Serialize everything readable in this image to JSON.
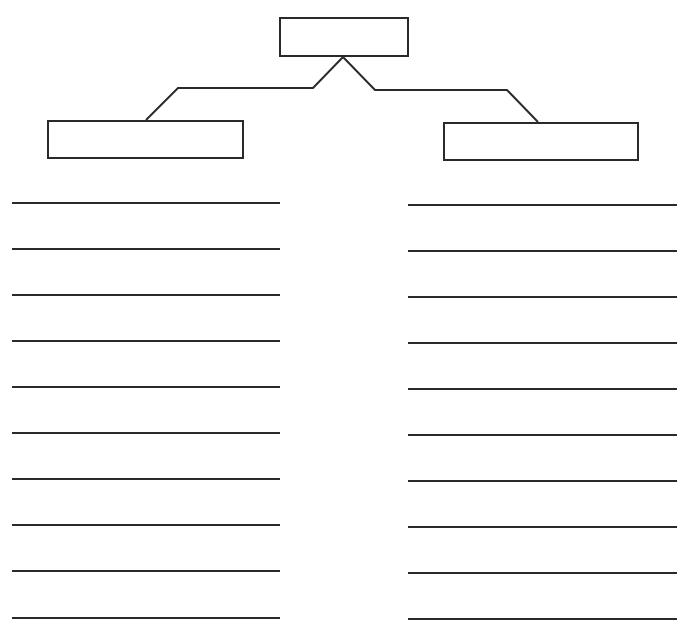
{
  "diagram": {
    "type": "hierarchy-worksheet",
    "stroke_color": "#2a2a2a",
    "background_color": "#ffffff",
    "top_box": {
      "label": "",
      "x": 279,
      "y": 17,
      "w": 130,
      "h": 40
    },
    "left_box": {
      "label": "",
      "x": 47,
      "y": 120,
      "w": 197,
      "h": 39
    },
    "right_box": {
      "label": "",
      "x": 443,
      "y": 122,
      "w": 196,
      "h": 39
    },
    "connectors": {
      "left": [
        [
          343,
          57
        ],
        [
          313,
          88
        ],
        [
          178,
          88
        ],
        [
          146,
          120
        ]
      ],
      "right": [
        [
          343,
          57
        ],
        [
          375,
          90
        ],
        [
          507,
          90
        ],
        [
          538,
          122
        ]
      ]
    },
    "left_column": {
      "x_start": 12,
      "x_end": 280,
      "lines": [
        {
          "y": 203,
          "text": ""
        },
        {
          "y": 249,
          "text": ""
        },
        {
          "y": 295,
          "text": ""
        },
        {
          "y": 341,
          "text": ""
        },
        {
          "y": 387,
          "text": ""
        },
        {
          "y": 433,
          "text": ""
        },
        {
          "y": 479,
          "text": ""
        },
        {
          "y": 525,
          "text": ""
        },
        {
          "y": 571,
          "text": ""
        },
        {
          "y": 618,
          "text": ""
        }
      ]
    },
    "right_column": {
      "x_start": 408,
      "x_end": 677,
      "lines": [
        {
          "y": 205,
          "text": ""
        },
        {
          "y": 251,
          "text": ""
        },
        {
          "y": 297,
          "text": ""
        },
        {
          "y": 343,
          "text": ""
        },
        {
          "y": 389,
          "text": ""
        },
        {
          "y": 435,
          "text": ""
        },
        {
          "y": 481,
          "text": ""
        },
        {
          "y": 527,
          "text": ""
        },
        {
          "y": 573,
          "text": ""
        },
        {
          "y": 619,
          "text": ""
        }
      ]
    }
  }
}
